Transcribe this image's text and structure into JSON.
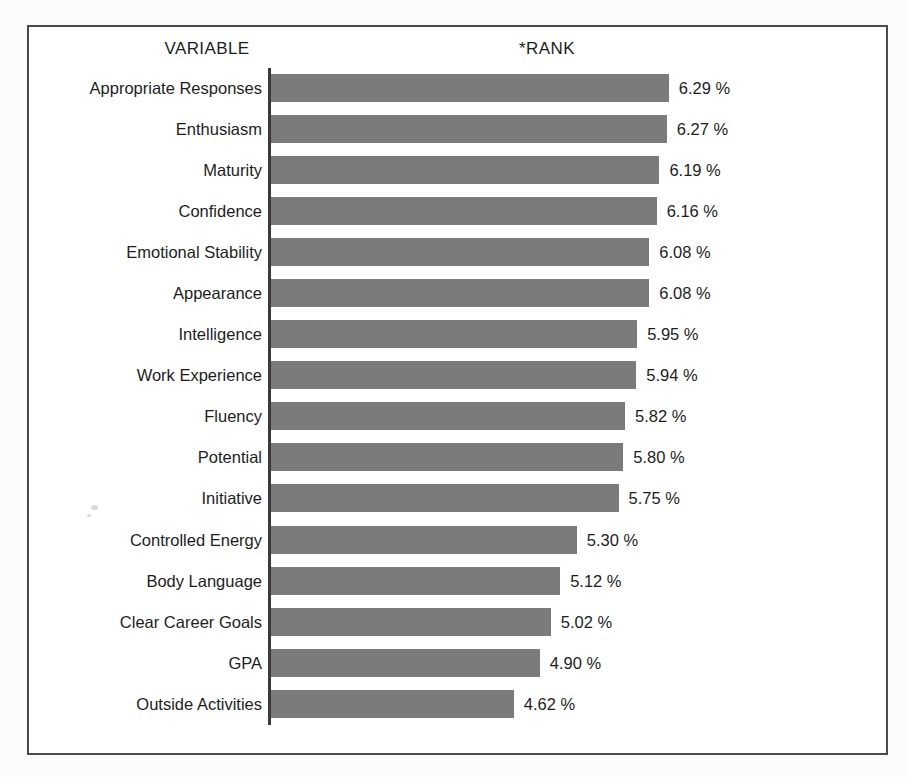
{
  "headers": {
    "variable": "VARIABLE",
    "rank": "*RANK"
  },
  "style": {
    "bar_color": "#7b7b7b",
    "frame_color": "#4a4a4a",
    "axis_color": "#3a3a3a",
    "text_color": "#1d1d1d",
    "background": "#ffffff"
  },
  "chart_data": {
    "type": "bar",
    "orientation": "horizontal",
    "title": "",
    "subtitle": "",
    "xlabel": "*RANK",
    "ylabel": "VARIABLE",
    "value_suffix": "%",
    "grid": false,
    "legend": null,
    "axis_origin": 0,
    "xlim": [
      0,
      6.9
    ],
    "categories": [
      "Appropriate Responses",
      "Enthusiasm",
      "Maturity",
      "Confidence",
      "Emotional Stability",
      "Appearance",
      "Intelligence",
      "Work Experience",
      "Fluency",
      "Potential",
      "Initiative",
      "Controlled Energy",
      "Body Language",
      "Clear Career Goals",
      "GPA",
      "Outside Activities"
    ],
    "values": [
      6.29,
      6.27,
      6.19,
      6.16,
      6.08,
      6.08,
      5.95,
      5.94,
      5.82,
      5.8,
      5.75,
      5.3,
      5.12,
      5.02,
      4.9,
      4.62
    ],
    "value_labels": [
      "6.29 %",
      "6.27 %",
      "6.19 %",
      "6.16 %",
      "6.08 %",
      "6.08 %",
      "5.95 %",
      "5.94 %",
      "5.82 %",
      "5.80 %",
      "5.75 %",
      "5.30 %",
      "5.12 %",
      "5.02 %",
      "4.90 %",
      "4.62 %"
    ]
  }
}
